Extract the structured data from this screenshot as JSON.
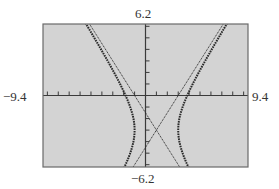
{
  "chart_data": {
    "type": "line",
    "title": "",
    "xlabel": "",
    "ylabel": "",
    "window": {
      "xmin": -9.4,
      "xmax": 9.4,
      "ymin": -6.2,
      "ymax": 6.2,
      "xscl": 1,
      "yscl": 1
    },
    "tick_labels": {
      "xmin": "−9.4",
      "xmax": "9.4",
      "ymin": "−6.2",
      "ymax": "6.2"
    },
    "grid": false,
    "legend": null,
    "series": [
      {
        "name": "hyperbola",
        "equation": "(x-1)^2/4 - (y+3)^2/9 = 1",
        "style": "dotted-thick",
        "center": [
          1,
          -3
        ],
        "a": 2,
        "b": 3
      },
      {
        "name": "asymptote-1",
        "equation": "y = 1.5(x-1) - 3",
        "style": "dotted-thin"
      },
      {
        "name": "asymptote-2",
        "equation": "y = -1.5(x-1) - 3",
        "style": "dotted-thin"
      }
    ],
    "colors": {
      "screen": "#d3d3d3",
      "axes": "#3a3a3a",
      "curve": "#2a2a2a",
      "frame": "#6a6a6a"
    }
  }
}
